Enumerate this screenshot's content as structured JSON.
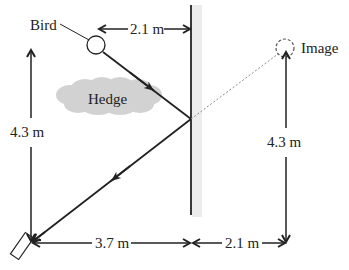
{
  "diagram": {
    "type": "plane-mirror-reflection",
    "labels": {
      "bird": "Bird",
      "image": "Image",
      "hedge": "Hedge",
      "top_distance": "2.1 m",
      "left_height": "4.3 m",
      "right_height": "4.3 m",
      "bottom_left_distance": "3.7 m",
      "bottom_right_distance": "2.1 m"
    },
    "elements": {
      "bird": {
        "shape": "circle",
        "style": "solid"
      },
      "image": {
        "shape": "circle",
        "style": "dashed"
      },
      "mirror": {
        "shape": "vertical-line",
        "backing": "gray-band"
      },
      "hedge": {
        "shape": "cloud",
        "color": "#d4d4d4"
      },
      "camera": {
        "shape": "tilted-rectangle"
      }
    },
    "colors": {
      "line": "#222222",
      "mirror_backing": "#ececec",
      "hedge": "#d2d2d2",
      "dotted_ray": "#888888"
    }
  }
}
